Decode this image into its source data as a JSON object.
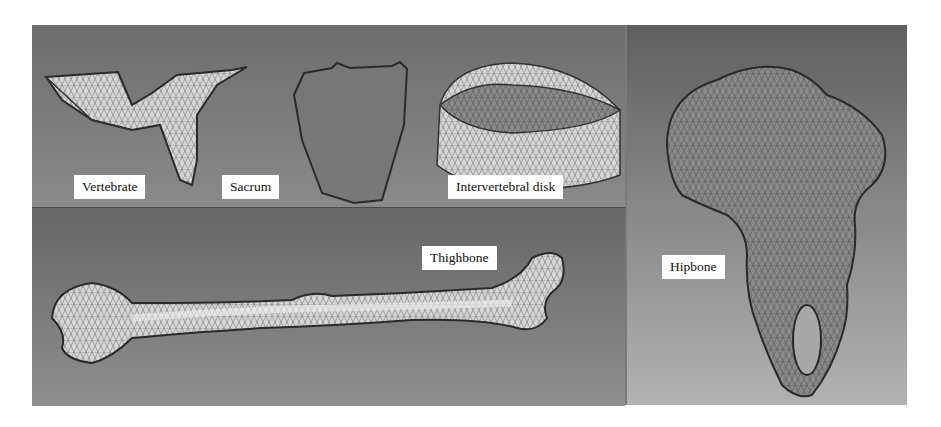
{
  "figure": {
    "panels": [
      {
        "id": "top-left",
        "labels": [
          "Vertebrate",
          "Sacrum",
          "Intervertebral disk"
        ]
      },
      {
        "id": "bottom-left",
        "labels": [
          "Thighbone"
        ]
      },
      {
        "id": "right",
        "labels": [
          "Hipbone"
        ]
      }
    ],
    "labels": {
      "vertebrate": "Vertebrate",
      "sacrum": "Sacrum",
      "intervertebral_disk": "Intervertebral disk",
      "thighbone": "Thighbone",
      "hipbone": "Hipbone"
    },
    "colors": {
      "background": "#7a7a7a",
      "mesh_light": "#d9d9d9",
      "mesh_line": "#3a3a3a",
      "label_bg": "#ffffff"
    }
  }
}
